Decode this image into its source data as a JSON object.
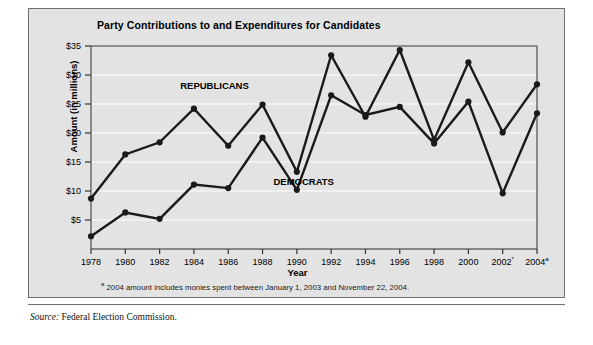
{
  "figure": {
    "title": "Party Contributions to and Expenditures for Candidates",
    "footnote_marker": "a",
    "footnote_text": " 2004 amount includes monies spent between January 1, 2003 and November 22, 2004.",
    "source_label": "Source:",
    "source_text": " Federal Election Commission.",
    "background_color": "#e3e3e3",
    "border_color": "#6e6e6e",
    "line_color": "#1a1a1a"
  },
  "chart_data": {
    "type": "line",
    "title": "Party Contributions to and Expenditures for Candidates",
    "xlabel": "Year",
    "ylabel": "Amount (in millions)",
    "categories": [
      "1978",
      "1980",
      "1982",
      "1984",
      "1986",
      "1988",
      "1990",
      "1992",
      "1994",
      "1996",
      "1998",
      "2000",
      "2002*",
      "2004a"
    ],
    "x": [
      1978,
      1980,
      1982,
      1984,
      1986,
      1988,
      1990,
      1992,
      1994,
      1996,
      1998,
      2000,
      2002,
      2004
    ],
    "ylim": [
      0,
      35
    ],
    "ytick_values": [
      5,
      10,
      15,
      20,
      25,
      30,
      35
    ],
    "ytick_labels": [
      "$5",
      "$10",
      "$15",
      "$20",
      "$25",
      "$30",
      "$35"
    ],
    "grid": true,
    "legend_position": "inline-annotation",
    "series": [
      {
        "name": "REPUBLICANS",
        "values": [
          8.7,
          16.3,
          18.4,
          24.2,
          17.8,
          24.9,
          13.3,
          33.4,
          22.8,
          34.3,
          18.8,
          32.2,
          20.1,
          28.4
        ]
      },
      {
        "name": "DEMOCRATS",
        "values": [
          2.2,
          6.3,
          5.2,
          11.1,
          10.5,
          19.2,
          10.2,
          26.5,
          23.1,
          24.5,
          18.2,
          25.4,
          9.6,
          23.4
        ]
      }
    ],
    "annotations": [
      {
        "text": "REPUBLICANS",
        "x": 1985.2,
        "y": 27.6
      },
      {
        "text": "DEMOCRATS",
        "x": 1990.4,
        "y": 11.0
      }
    ]
  }
}
